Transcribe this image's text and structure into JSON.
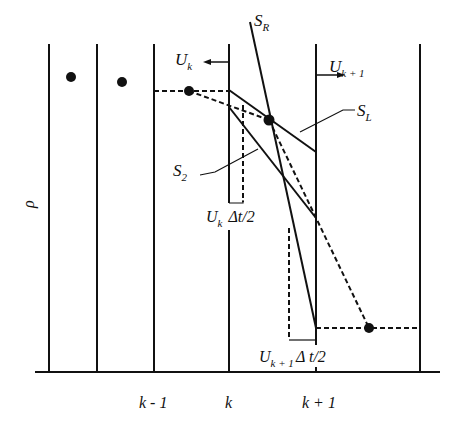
{
  "diagram": {
    "type": "finite-volume cell diagram (density vs. position)",
    "y_axis_label": "ρ",
    "x_tick_labels": [
      {
        "text": "k - 1",
        "x": 153
      },
      {
        "text": "k",
        "x": 229
      },
      {
        "text": "k + 1",
        "x": 316
      }
    ],
    "velocity_labels": {
      "left": {
        "main": "U",
        "sub": "k",
        "arrow": "left"
      },
      "right": {
        "main": "U",
        "sub": "k + 1",
        "arrow": "right"
      }
    },
    "line_labels": {
      "s_r": {
        "main": "S",
        "sub": "R"
      },
      "s_l": {
        "main": "S",
        "sub": "L"
      },
      "s_2": {
        "main": "S",
        "sub": "2"
      }
    },
    "displacement_labels": {
      "upper": {
        "main": "U",
        "sub": "k",
        "rest": "Δt/2"
      },
      "lower": {
        "main": "U",
        "sub": "k + 1",
        "rest": "Δ t/2"
      }
    },
    "colors": {
      "ink": "#111111",
      "background": "#ffffff"
    }
  }
}
